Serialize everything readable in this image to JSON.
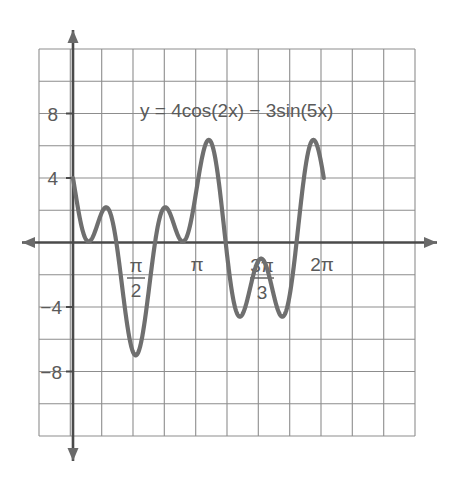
{
  "chart_data": {
    "type": "line",
    "title": "y = 4cos(2x) − 3sin(5x)",
    "equation": {
      "lhs": "y",
      "equals": "=",
      "term1_coeff": "4",
      "term1_fn": "cos",
      "term1_arg": "(2x)",
      "operator": "−",
      "term2_coeff": "3",
      "term2_fn": "sin",
      "term2_arg": "(5x)",
      "full": "y = 4cos(2x) − 3sin(5x)"
    },
    "xlabel": "",
    "ylabel": "",
    "xlim": [
      -1.1,
      8.4
    ],
    "ylim": [
      -12,
      12
    ],
    "grid": true,
    "legend": false,
    "x_tick_labels": [
      {
        "text": "π/2",
        "numerator": "π",
        "denominator": "2",
        "x_value": 1.5707963
      },
      {
        "text": "π",
        "numerator": "π",
        "denominator": "",
        "x_value": 3.1415927
      },
      {
        "text": "3π/3",
        "numerator": "3π",
        "denominator": "3",
        "x_value": 4.712389
      },
      {
        "text": "2π",
        "numerator": "2π",
        "denominator": "",
        "x_value": 6.2831853
      }
    ],
    "y_tick_labels": [
      {
        "text": "8",
        "y_value": 8
      },
      {
        "text": "4",
        "y_value": 4
      },
      {
        "text": "−4",
        "y_value": -4
      },
      {
        "text": "−8",
        "y_value": -8
      }
    ],
    "grid_spacing_x_units": 0.7853982,
    "grid_spacing_y_units": 2,
    "x_domain_plotted": [
      0,
      6.2831853
    ],
    "curve_color": "#6f6f6f",
    "grid_color": "#8d8d8d",
    "axis_color": "#4a4a4a",
    "series": [
      {
        "name": "y = 4cos(2x) − 3sin(5x)",
        "key_points": [
          {
            "x": 0.0,
            "y": 4.0,
            "note": "start"
          },
          {
            "x": 0.38,
            "y": 0.05,
            "note": "local minimum"
          },
          {
            "x": 0.72,
            "y": 2.35,
            "note": "local maximum"
          },
          {
            "x": 1.5,
            "y": -7.0,
            "note": "global minimum"
          },
          {
            "x": 2.25,
            "y": 2.3,
            "note": "local maximum"
          },
          {
            "x": 2.55,
            "y": 0.1,
            "note": "local minimum"
          },
          {
            "x": 3.2,
            "y": 6.3,
            "note": "local maximum"
          },
          {
            "x": 4.1,
            "y": -4.4,
            "note": "local minimum"
          },
          {
            "x": 4.6,
            "y": -1.1,
            "note": "local maximum"
          },
          {
            "x": 5.1,
            "y": -4.5,
            "note": "local minimum"
          },
          {
            "x": 5.95,
            "y": 6.3,
            "note": "local maximum"
          },
          {
            "x": 6.2831853,
            "y": 4.0,
            "note": "end"
          }
        ]
      }
    ],
    "axis_arrows": {
      "x_left": true,
      "x_right": true,
      "y_up": true,
      "y_down": true
    }
  }
}
